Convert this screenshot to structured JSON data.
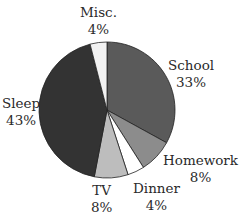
{
  "chart_data": {
    "type": "pie",
    "title": "",
    "categories": [
      "School",
      "Homework",
      "Dinner",
      "TV",
      "Sleep",
      "Misc."
    ],
    "values": [
      33,
      8,
      4,
      8,
      43,
      4
    ],
    "unit": "%",
    "colors": [
      "#5a5a5a",
      "#8c8c8c",
      "#ffffff",
      "#bdbdbd",
      "#333333",
      "#f2f2f2"
    ],
    "start_angle_deg": 90,
    "direction": "clockwise",
    "legend": "none",
    "labels_outside": true
  },
  "labels": [
    {
      "name": "School",
      "pct": "33%"
    },
    {
      "name": "Homework",
      "pct": "8%"
    },
    {
      "name": "Dinner",
      "pct": "4%"
    },
    {
      "name": "TV",
      "pct": "8%"
    },
    {
      "name": "Sleep",
      "pct": "43%"
    },
    {
      "name": "Misc.",
      "pct": "4%"
    }
  ]
}
